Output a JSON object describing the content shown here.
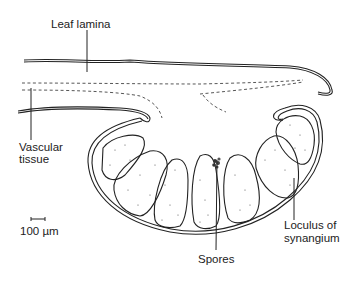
{
  "figure": {
    "labels": {
      "leaf_lamina": "Leaf lamina",
      "vascular_tissue_line1": "Vascular",
      "vascular_tissue_line2": "tissue",
      "scale_bar": "100 µm",
      "spores": "Spores",
      "loculus_line1": "Loculus of",
      "loculus_line2": "synangium"
    },
    "colors": {
      "line": "#222222",
      "background": "#ffffff"
    }
  }
}
